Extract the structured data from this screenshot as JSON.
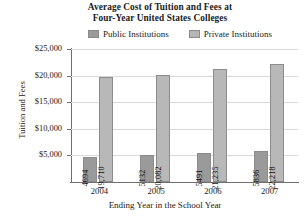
{
  "chart_data": {
    "type": "bar",
    "title": "Average Cost of Tuition and Fees at Four-Year United States Colleges",
    "title_line1": "Average Cost of Tuition and Fees at",
    "title_line2": "Four-Year United States Colleges",
    "xlabel": "Ending Year in the School Year",
    "ylabel": "Tuition and Fees",
    "categories": [
      "2004",
      "2005",
      "2006",
      "2007"
    ],
    "series": [
      {
        "name": "Public Institutions",
        "color": "#9a9a9a",
        "values": [
          4694,
          5132,
          5491,
          5836
        ],
        "labels": [
          "4694",
          "5132",
          "5491",
          "5836"
        ]
      },
      {
        "name": "Private Institutions",
        "color": "#b8b8b8",
        "values": [
          19710,
          20082,
          21235,
          22218
        ],
        "labels": [
          "19,710",
          "20,082",
          "21,235",
          "22,218"
        ]
      }
    ],
    "ylim": [
      0,
      25000
    ],
    "yticks": [
      5000,
      10000,
      15000,
      20000,
      25000
    ],
    "ytick_labels": [
      "$5,000",
      "$10,000",
      "$15,000",
      "$20,000",
      "$25,000"
    ],
    "grid": true,
    "legend_position": "top"
  }
}
